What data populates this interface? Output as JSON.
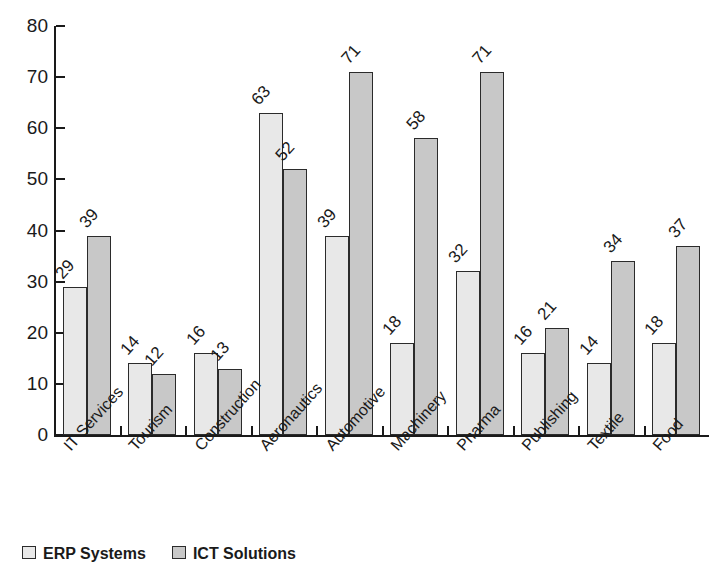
{
  "chart_data": {
    "type": "bar",
    "title": "",
    "subtitle": "",
    "xlabel": "",
    "ylabel": "",
    "ylim": [
      0,
      80
    ],
    "ytick_step": 10,
    "yticks": [
      0,
      10,
      20,
      30,
      40,
      50,
      60,
      70,
      80
    ],
    "grid": false,
    "legend_position": "bottom-left",
    "orientation": "vertical",
    "grouping": "grouped",
    "label_rotation_deg": -48,
    "categories": [
      "IT Services",
      "Tourism",
      "Construction",
      "Aeronautics",
      "Automotive",
      "Machinery",
      "Pharma",
      "Publishing",
      "Textile",
      "Food"
    ],
    "series": [
      {
        "name": "ERP Systems",
        "color": "#e8e8e8",
        "values": [
          29,
          14,
          16,
          63,
          39,
          18,
          32,
          16,
          14,
          18
        ]
      },
      {
        "name": "ICT Solutions",
        "color": "#c8c8c8",
        "values": [
          39,
          12,
          13,
          52,
          71,
          58,
          71,
          21,
          34,
          37
        ]
      }
    ]
  },
  "colors": {
    "axis": "#1a1a1a",
    "bar_outline": "#2b2b2b",
    "series_light": "#e8e8e8",
    "series_dark": "#c8c8c8",
    "background": "#ffffff"
  }
}
